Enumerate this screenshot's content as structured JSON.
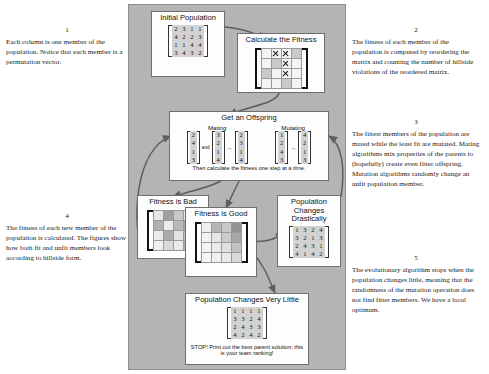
{
  "notes": [
    {
      "num": "1",
      "text": "Each column is one member of the population. Notice that each member is a permutation vector."
    },
    {
      "num": "2",
      "text": "The fitness of each member of the population is computed by reordering the matrix and counting the number of hillside violations of the reordered matrix."
    },
    {
      "num": "3",
      "text": "The fittest members of the population are mated while the least fit are mutated. Mating algorithms mix properties of the parents to (hopefully) create even fitter offspring. Mutation algorithms randomly change an unfit population member."
    },
    {
      "num": "4",
      "text": "The fitness of each new member of the population is calculated. The figures show how both fit and unfit members look according to hillside form."
    },
    {
      "num": "5",
      "text": "The evolutionary algorithm stops when the population changes little, meaning that the randomness of the mutation operation does not find fitter members. We have a local optimum."
    }
  ],
  "diagram": {
    "initial_population": {
      "title": "Initial Population",
      "matrix": [
        [
          2,
          3,
          1,
          1
        ],
        [
          4,
          2,
          2,
          3
        ],
        [
          1,
          1,
          4,
          4
        ],
        [
          3,
          4,
          3,
          2
        ]
      ]
    },
    "calculate_fitness": {
      "title": "Calculate the Fitness",
      "grid_rows": 4,
      "grid_cols": 4,
      "x_marks": [
        [
          0,
          1
        ],
        [
          0,
          2
        ],
        [
          1,
          2
        ],
        [
          2,
          2
        ]
      ],
      "shaded": [
        [
          0,
          3
        ],
        [
          1,
          1
        ],
        [
          2,
          0
        ],
        [
          3,
          2
        ]
      ]
    },
    "offspring": {
      "title": "Get an Offspring",
      "caption": "Then calculate the fitness one step at a time.",
      "mating": {
        "label": "Mating",
        "parent_a": [
          2,
          4,
          1,
          3
        ],
        "operator": "and",
        "parent_b": [
          3,
          2,
          1,
          4
        ],
        "arrow": "→",
        "child": [
          2,
          3,
          1,
          4
        ]
      },
      "mutating": {
        "label": "Mutating",
        "source": [
          1,
          2,
          4,
          3
        ],
        "arrow": "→",
        "result": [
          4,
          2,
          1,
          3
        ]
      }
    },
    "fitness_bad": {
      "title": "Fitness is Bad",
      "shades": [
        [
          0.12,
          0.55,
          0.3,
          0.1
        ],
        [
          0.45,
          0.08,
          0.4,
          0.52
        ],
        [
          0.1,
          0.48,
          0.14,
          0.34
        ],
        [
          0.06,
          0.2,
          0.1,
          0.44
        ]
      ]
    },
    "fitness_good": {
      "title": "Fitness is Good",
      "shades": [
        [
          0.06,
          0.42,
          0.3,
          0.62
        ],
        [
          0.05,
          0.12,
          0.28,
          0.5
        ],
        [
          0.04,
          0.1,
          0.16,
          0.34
        ],
        [
          0.03,
          0.06,
          0.1,
          0.2
        ]
      ]
    },
    "changes_drastically": {
      "title": "Population Changes Drastically",
      "matrix": [
        [
          1,
          3,
          2,
          4
        ],
        [
          3,
          2,
          1,
          3
        ],
        [
          2,
          4,
          3,
          1
        ],
        [
          4,
          1,
          4,
          2
        ]
      ]
    },
    "changes_very_little": {
      "title": "Population Changes Very Little",
      "matrix": [
        [
          1,
          1,
          1,
          1
        ],
        [
          3,
          3,
          2,
          4
        ],
        [
          2,
          4,
          3,
          3
        ],
        [
          4,
          2,
          4,
          2
        ]
      ],
      "caption": "STOP! Print out the best parent solution; this is your team ranking!"
    }
  },
  "colors": {
    "canvas": "#b4b4b4",
    "node_fill": "#fdfdfd",
    "node_border": "#6f6f6f",
    "edge": "#5e5e5e",
    "matrix_fill": "#d2d2d2"
  }
}
